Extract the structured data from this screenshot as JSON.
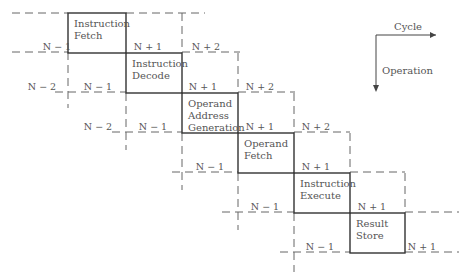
{
  "stages": [
    {
      "x": 68,
      "y": 13,
      "w": 58,
      "h": 40,
      "lines": [
        "Instruction",
        "Fetch"
      ]
    },
    {
      "x": 126,
      "y": 53,
      "w": 56,
      "h": 40,
      "lines": [
        "Instruction",
        "Decode"
      ]
    },
    {
      "x": 182,
      "y": 93,
      "w": 56,
      "h": 40,
      "lines": [
        "Operand",
        "Address",
        "Generation"
      ]
    },
    {
      "x": 238,
      "y": 133,
      "w": 56,
      "h": 40,
      "lines": [
        "Operand",
        "Fetch"
      ]
    },
    {
      "x": 294,
      "y": 173,
      "w": 56,
      "h": 40,
      "lines": [
        "Instruction",
        "Execute"
      ]
    },
    {
      "x": 350,
      "y": 213,
      "w": 55,
      "h": 40,
      "lines": [
        "Result",
        "Store"
      ]
    }
  ],
  "dashed_lines": [
    [
      12,
      13,
      68,
      13
    ],
    [
      126,
      13,
      205,
      13
    ],
    [
      12,
      52,
      68,
      52
    ],
    [
      182,
      52,
      240,
      52
    ],
    [
      55,
      92,
      126,
      92
    ],
    [
      238,
      92,
      295,
      92
    ],
    [
      112,
      132,
      182,
      132
    ],
    [
      294,
      132,
      350,
      132
    ],
    [
      172,
      172,
      238,
      172
    ],
    [
      350,
      172,
      405,
      172
    ],
    [
      222,
      212,
      294,
      212
    ],
    [
      405,
      212,
      459,
      212
    ],
    [
      280,
      252,
      350,
      252
    ],
    [
      405,
      252,
      459,
      252
    ],
    [
      68,
      52,
      68,
      108
    ],
    [
      182,
      13,
      182,
      53
    ],
    [
      126,
      93,
      126,
      150
    ],
    [
      238,
      53,
      238,
      93
    ],
    [
      182,
      133,
      182,
      190
    ],
    [
      294,
      93,
      294,
      133
    ],
    [
      238,
      173,
      238,
      230
    ],
    [
      350,
      133,
      350,
      173
    ],
    [
      294,
      213,
      294,
      272
    ],
    [
      405,
      173,
      405,
      213
    ]
  ],
  "cycle_labels": [
    {
      "x": 57,
      "y": 50,
      "text": "N − 1"
    },
    {
      "x": 148,
      "y": 50,
      "text": "N + 1"
    },
    {
      "x": 206,
      "y": 50,
      "text": "N + 2"
    },
    {
      "x": 42,
      "y": 90,
      "text": "N − 2"
    },
    {
      "x": 98,
      "y": 90,
      "text": "N − 1"
    },
    {
      "x": 203,
      "y": 90,
      "text": "N + 1"
    },
    {
      "x": 260,
      "y": 90,
      "text": "N + 2"
    },
    {
      "x": 98,
      "y": 130,
      "text": "N − 2"
    },
    {
      "x": 153,
      "y": 130,
      "text": "N − 1"
    },
    {
      "x": 260,
      "y": 130,
      "text": "N + 1"
    },
    {
      "x": 316,
      "y": 130,
      "text": "N + 2"
    },
    {
      "x": 210,
      "y": 170,
      "text": "N − 1"
    },
    {
      "x": 316,
      "y": 170,
      "text": "N + 1"
    },
    {
      "x": 265,
      "y": 210,
      "text": "N − 1"
    },
    {
      "x": 372,
      "y": 210,
      "text": "N + 1"
    },
    {
      "x": 320,
      "y": 250,
      "text": "N − 1"
    },
    {
      "x": 422,
      "y": 250,
      "text": "N + 1"
    }
  ],
  "legend": {
    "cycle": "Cycle",
    "operation": "Operation"
  }
}
